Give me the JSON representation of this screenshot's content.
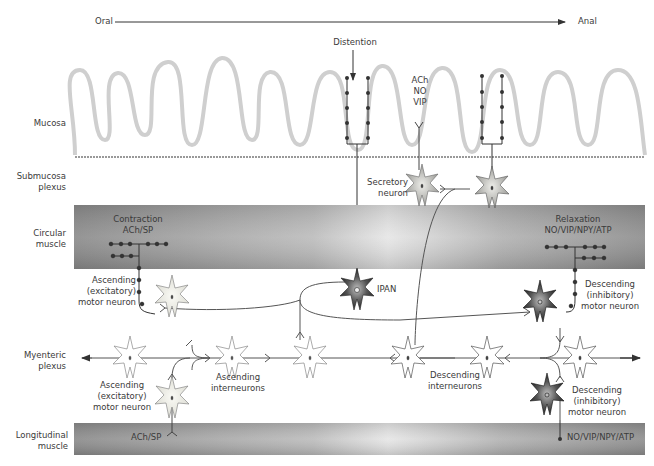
{
  "axis": {
    "left": "Oral",
    "right": "Anal"
  },
  "stimulus": "Distention",
  "layers": {
    "mucosa": "Mucosa",
    "submucosa": [
      "Submucosa",
      "plexus"
    ],
    "circular": [
      "Circular",
      "muscle"
    ],
    "myenteric": [
      "Myenteric",
      "plexus"
    ],
    "longitudinal": [
      "Longitudinal",
      "muscle"
    ]
  },
  "mediators": {
    "secretory": [
      "ACh",
      "NO",
      "VIP"
    ],
    "contraction_title": "Contraction",
    "contraction_tx": "ACh/SP",
    "relaxation_title": "Relaxation",
    "relaxation_tx": "NO/VIP/NPY/ATP",
    "long_excit": "ACh/SP",
    "long_inhib": "NO/VIP/NPY/ATP"
  },
  "neurons": {
    "secretory": [
      "Secretory",
      "neuron"
    ],
    "ipan": "IPAN",
    "asc_motor_circ": [
      "Ascending",
      "(excitatory)",
      "motor neuron"
    ],
    "desc_motor_circ": [
      "Descending",
      "(inhibitory)",
      "motor neuron"
    ],
    "asc_inter": [
      "Ascending",
      "interneurons"
    ],
    "desc_inter": [
      "Descending",
      "interneurons"
    ],
    "asc_motor_long": [
      "Ascending",
      "(excitatory)",
      "motor neuron"
    ],
    "desc_motor_long": [
      "Descending",
      "(inhibitory)",
      "motor neuron"
    ]
  },
  "colors": {
    "muscle_dark": "#8a8a8a",
    "muscle_light": "#e4e4e4",
    "mucosa_outline": "#d0d0d0",
    "neuron_dark": "#2a2a2a",
    "neuron_light": "#efefe8"
  }
}
